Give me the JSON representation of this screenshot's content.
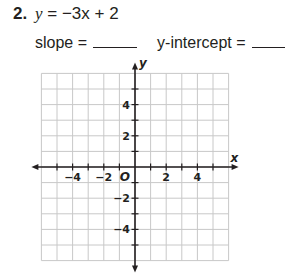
{
  "problem": {
    "number": "2.",
    "equation_lhs": "y",
    "equation_rhs": "= −3x + 2",
    "slope_label": "slope =",
    "intercept_label": "y-intercept ="
  },
  "graph": {
    "x_axis_label": "x",
    "y_axis_label": "y",
    "origin_label": "O",
    "x_tick_labels": [
      "−4",
      "−2",
      "2",
      "4"
    ],
    "y_tick_labels": [
      "4",
      "2",
      "−2",
      "−4"
    ],
    "x_range": [
      -6,
      6
    ],
    "y_range": [
      -6,
      6
    ],
    "grid_color": "#c8c8c8",
    "axis_color": "#231f20"
  }
}
